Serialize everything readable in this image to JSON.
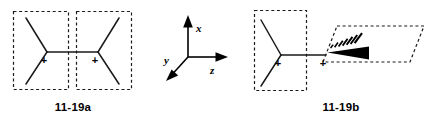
{
  "figure": {
    "background_color": "#ffffff",
    "ink_color": "#1a1a1a",
    "width": 439,
    "height": 126
  },
  "structures": [
    {
      "id": "structure-left",
      "caption": "11-19a",
      "description": "Two sp2 carbocation centers, each drawn inside an upright dashed rectangular plane, joined by a horizontal carbon-carbon bond; planes are coplanar (both parallel to the page).",
      "charge_symbols": [
        "+",
        "+"
      ],
      "plane_count": 2,
      "plane_style": "dashed-rectangle"
    },
    {
      "id": "structure-right",
      "caption": "11-19b",
      "description": "Left sp2 carbocation center inside an upright dashed rectangular plane joined to a right carbocation center lying in a dashed parallelogram plane rotated perpendicular, drawn with hashed and solid wedge bonds.",
      "charge_symbols": [
        "+",
        "+"
      ],
      "plane_count": 2,
      "plane_style": "dashed-rectangle-and-parallelogram",
      "wedge_bond": "solid-wedge",
      "hash_bond": "hashed-wedge",
      "hash_mark_count": 7
    }
  ],
  "axes": {
    "name": "coordinate-axes",
    "x_label": "x",
    "y_label": "y",
    "z_label": "z",
    "x_direction": "up",
    "y_direction": "down-left",
    "z_direction": "right"
  },
  "captions": {
    "left": "11-19a",
    "right": "11-19b"
  }
}
